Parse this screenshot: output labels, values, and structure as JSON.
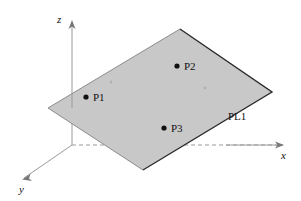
{
  "figure": {
    "type": "3d-plane-diagram",
    "background_color": "#ffffff",
    "plane": {
      "name": "PL1",
      "label": "PL1",
      "label_position": {
        "x": 228,
        "y": 111
      },
      "fill_color": "#c6c6c6",
      "edge_color": "#6a6a6a",
      "shadow_edge_color": "#2b2b2b",
      "corners": [
        {
          "name": "left",
          "x": 48,
          "y": 108
        },
        {
          "name": "top",
          "x": 180,
          "y": 29
        },
        {
          "name": "right",
          "x": 272,
          "y": 92
        },
        {
          "name": "bottom",
          "x": 143,
          "y": 170
        }
      ]
    },
    "axes": [
      {
        "name": "z",
        "label": "z",
        "label_position": {
          "x": 57,
          "y": 14
        },
        "from": {
          "x": 72,
          "y": 145
        },
        "to": {
          "x": 72,
          "y": 21
        },
        "color": "#9a9a9a",
        "arrow": true
      },
      {
        "name": "x",
        "label": "x",
        "label_position": {
          "x": 281,
          "y": 150
        },
        "from": {
          "x": 72,
          "y": 145
        },
        "to": {
          "x": 283,
          "y": 145
        },
        "color": "#9a9a9a",
        "arrow": true,
        "hidden_segment_dashed": true
      },
      {
        "name": "y",
        "label": "y",
        "label_position": {
          "x": 19,
          "y": 184
        },
        "from": {
          "x": 72,
          "y": 145
        },
        "to": {
          "x": 22,
          "y": 179
        },
        "color": "#9a9a9a",
        "arrow": true
      }
    ],
    "points": [
      {
        "name": "P1",
        "label": "P1",
        "x": 86,
        "y": 97,
        "radius": 2.6,
        "color": "#111111",
        "label_position": {
          "x": 93,
          "y": 92
        }
      },
      {
        "name": "P2",
        "label": "P2",
        "x": 177,
        "y": 66,
        "radius": 2.6,
        "color": "#111111",
        "label_position": {
          "x": 184,
          "y": 61
        }
      },
      {
        "name": "P3",
        "label": "P3",
        "x": 164,
        "y": 128,
        "radius": 2.6,
        "color": "#111111",
        "label_position": {
          "x": 171,
          "y": 123
        }
      }
    ],
    "faint_marks": [
      {
        "name": "faint-mark-left",
        "x": 111,
        "y": 82
      },
      {
        "name": "faint-mark-right",
        "x": 205,
        "y": 88
      }
    ]
  }
}
